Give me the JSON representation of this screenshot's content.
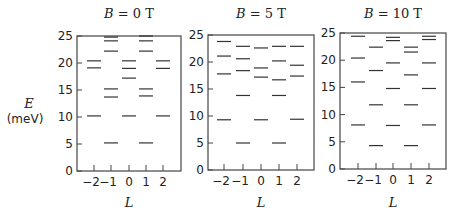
{
  "ylabel": {
    "symbol": "E",
    "unit": "(meV)"
  },
  "xlabel": "L",
  "chart_data": [
    {
      "type": "scatter",
      "title": "B = 0 T",
      "xlabel": "L",
      "ylabel": "E (meV)",
      "ylim": [
        0,
        25
      ],
      "yticks": [
        0,
        5,
        10,
        15,
        20,
        25
      ],
      "xticks": [
        -2,
        -1,
        0,
        1,
        2
      ],
      "grid": false,
      "levels": [
        {
          "L": -2,
          "E": [
            20.4,
            19.1,
            10.2
          ]
        },
        {
          "L": -1,
          "E": [
            24.8,
            24.1,
            22.2,
            15.2,
            13.7,
            5.2
          ]
        },
        {
          "L": 0,
          "E": [
            20.4,
            19.0,
            17.2,
            10.2
          ]
        },
        {
          "L": 1,
          "E": [
            25.0,
            24.1,
            22.2,
            15.2,
            13.9,
            5.2
          ]
        },
        {
          "L": 2,
          "E": [
            20.4,
            19.0,
            10.2
          ]
        }
      ]
    },
    {
      "type": "scatter",
      "title": "B = 5 T",
      "xlabel": "L",
      "ylabel": "E (meV)",
      "ylim": [
        0,
        25
      ],
      "yticks": [
        0,
        5,
        10,
        15,
        20,
        25
      ],
      "xticks": [
        -2,
        -1,
        0,
        1,
        2
      ],
      "grid": false,
      "levels": [
        {
          "L": -2,
          "E": [
            23.8,
            21.1,
            17.8,
            9.3
          ]
        },
        {
          "L": -1,
          "E": [
            22.9,
            20.6,
            18.4,
            13.8,
            5.0
          ]
        },
        {
          "L": 0,
          "E": [
            22.6,
            18.9,
            17.2,
            9.3
          ]
        },
        {
          "L": 1,
          "E": [
            22.9,
            20.2,
            16.7,
            13.8,
            5.0
          ]
        },
        {
          "L": 2,
          "E": [
            22.9,
            19.4,
            17.4,
            9.4
          ]
        }
      ]
    },
    {
      "type": "scatter",
      "title": "B = 10 T",
      "xlabel": "L",
      "ylabel": "E (meV)",
      "ylim": [
        0,
        25
      ],
      "yticks": [
        0,
        5,
        10,
        15,
        20,
        25
      ],
      "xticks": [
        -2,
        -1,
        0,
        1,
        2
      ],
      "grid": false,
      "levels": [
        {
          "L": -2,
          "E": [
            24.4,
            20.4,
            16.0,
            8.1
          ]
        },
        {
          "L": -1,
          "E": [
            22.4,
            18.1,
            11.8,
            4.3
          ]
        },
        {
          "L": 0,
          "E": [
            24.2,
            23.6,
            19.5,
            14.8,
            8.0
          ]
        },
        {
          "L": 1,
          "E": [
            22.4,
            21.5,
            17.3,
            11.8,
            4.3
          ]
        },
        {
          "L": 2,
          "E": [
            24.4,
            23.8,
            19.5,
            14.8,
            8.1
          ]
        }
      ]
    }
  ]
}
